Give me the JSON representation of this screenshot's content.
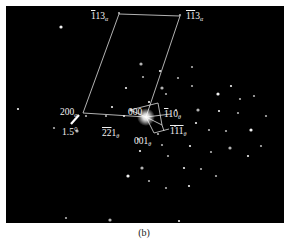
{
  "figure": {
    "background": "#000000",
    "spot_color": "#ffffff",
    "line_color": "#e6e6e6",
    "labels": {
      "top_left": {
        "prefix_over": "1",
        "rest": "13",
        "sub": "α"
      },
      "top_right": {
        "prefix_over": "11",
        "rest": "3",
        "sub": "α"
      },
      "left": {
        "prefix_over": "",
        "rest": "200",
        "sub": "α"
      },
      "angle": "1.5°",
      "origin": "000",
      "mid_bottom": {
        "prefix_over": "22",
        "rest": "1",
        "sub": "θ"
      },
      "right_upper": {
        "prefix_over": "1",
        "rest": "10",
        "sub": "θ"
      },
      "right_lower": {
        "prefix_over": "111",
        "rest": "",
        "sub": "θ"
      },
      "bottom_center": {
        "prefix_over": "",
        "rest": "001",
        "sub": "θ"
      }
    },
    "spots": [
      [
        55,
        21
      ],
      [
        113,
        7
      ],
      [
        174,
        9
      ],
      [
        12,
        103
      ],
      [
        48,
        122
      ],
      [
        135,
        58
      ],
      [
        154,
        65
      ],
      [
        137,
        71
      ],
      [
        172,
        72
      ],
      [
        120,
        82
      ],
      [
        156,
        82
      ],
      [
        186,
        80
      ],
      [
        225,
        80
      ],
      [
        186,
        61
      ],
      [
        234,
        93
      ],
      [
        212,
        88
      ],
      [
        248,
        90
      ],
      [
        160,
        88
      ],
      [
        143,
        96
      ],
      [
        170,
        104
      ],
      [
        192,
        104
      ],
      [
        213,
        105
      ],
      [
        232,
        107
      ],
      [
        260,
        110
      ],
      [
        106,
        101
      ],
      [
        125,
        104
      ],
      [
        169,
        120
      ],
      [
        190,
        117
      ],
      [
        203,
        124
      ],
      [
        220,
        125
      ],
      [
        245,
        124
      ],
      [
        152,
        128
      ],
      [
        156,
        139
      ],
      [
        184,
        140
      ],
      [
        205,
        146
      ],
      [
        224,
        142
      ],
      [
        242,
        150
      ],
      [
        255,
        140
      ],
      [
        132,
        133
      ],
      [
        134,
        145
      ],
      [
        136,
        162
      ],
      [
        162,
        150
      ],
      [
        178,
        162
      ],
      [
        195,
        163
      ],
      [
        210,
        170
      ],
      [
        122,
        170
      ],
      [
        143,
        175
      ],
      [
        160,
        182
      ],
      [
        183,
        180
      ],
      [
        60,
        212
      ],
      [
        104,
        214
      ],
      [
        173,
        215
      ],
      [
        80,
        110
      ],
      [
        100,
        110
      ],
      [
        118,
        110
      ],
      [
        71,
        125
      ]
    ],
    "center": [
      140,
      111
    ]
  },
  "caption": "(b)"
}
